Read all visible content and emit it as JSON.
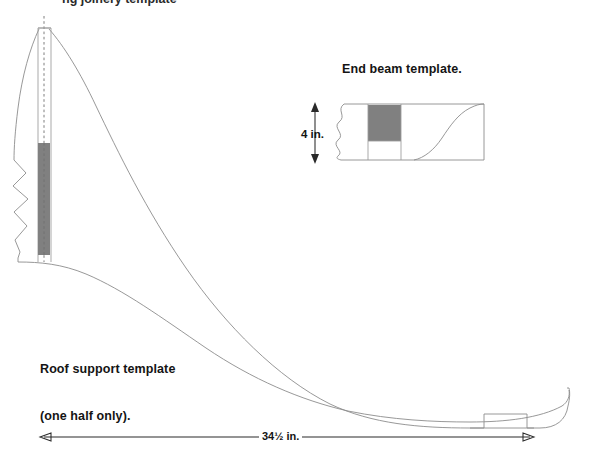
{
  "page": {
    "width": 593,
    "height": 459,
    "background": "#ffffff",
    "cut_off_top_text": "ng joinery template",
    "line_color": "#8c8c8c",
    "dim_color": "#2a2a2a",
    "shade_color": "#808080",
    "text_color": "#141414"
  },
  "end_beam": {
    "title": "End beam template.",
    "dimension_label": "4 in.",
    "shaded_block": {
      "fill": "#808080",
      "x": 368,
      "y": 105,
      "width": 33,
      "height": 36
    },
    "outline": {
      "left": 338,
      "right": 484,
      "top": 104,
      "bottom": 160
    },
    "features": [
      "break-line-left-wavy",
      "shaded-tenon-block",
      "vertical-division-line",
      "ogee-curve-right"
    ]
  },
  "roof_support": {
    "title_line1": "Roof support template",
    "title_line2": "(one half only).",
    "dimension_label": "34½ in.",
    "dimension": {
      "value": "34½",
      "unit": "in.",
      "x_start": 40,
      "x_end": 534,
      "y": 437
    },
    "shaded_band": {
      "fill": "#808080",
      "x": 38,
      "y": 143,
      "width": 12,
      "height": 112
    },
    "centerline": {
      "x": 44,
      "y_top": 16,
      "y_bottom": 262,
      "style": "dashed"
    },
    "features": [
      "dashed-centerline",
      "break-line-left-wavy",
      "shaded-tenon-band",
      "long-ogee-curve",
      "bottom-notch-tab",
      "rounded-right-end"
    ]
  },
  "icons": {
    "arrow_up": "arrow-up-icon",
    "arrow_down": "arrow-down-icon",
    "arrow_left": "arrow-left-icon",
    "arrow_right": "arrow-right-icon"
  }
}
